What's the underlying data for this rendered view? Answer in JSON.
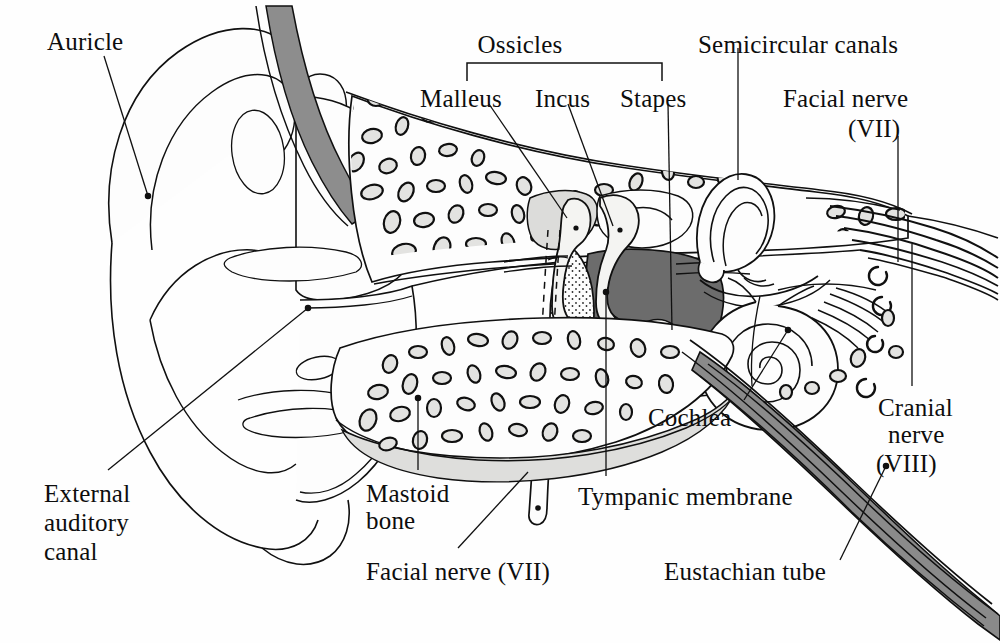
{
  "figure": {
    "background_color": "#fefefe",
    "ink_color": "#101010"
  },
  "palette": {
    "ink": "#101010",
    "paper": "#fefefe",
    "cartilage_light": "#f2f2f0",
    "bone_light_gray": "#e6e6e4",
    "canal_gray": "#8d8d8d",
    "middle_ear_cavity": "#6c6c6c",
    "eustachian_gray": "#8a8a8a",
    "marrow_fill": "#d9d9d7"
  },
  "labels": [
    {
      "id": "auricle",
      "text": "Auricle",
      "x": 47,
      "y": 28,
      "align": "left"
    },
    {
      "id": "ossicles",
      "text": "Ossicles",
      "x": 519,
      "y": 31,
      "align": "center"
    },
    {
      "id": "semicircular",
      "text": "Semicircular canals",
      "x": 698,
      "y": 31,
      "align": "left"
    },
    {
      "id": "malleus",
      "text": "Malleus",
      "x": 420,
      "y": 85,
      "align": "left"
    },
    {
      "id": "incus",
      "text": "Incus",
      "x": 535,
      "y": 85,
      "align": "left"
    },
    {
      "id": "stapes",
      "text": "Stapes",
      "x": 620,
      "y": 85,
      "align": "left"
    },
    {
      "id": "facial-nerve-vii",
      "text": "Facial nerve",
      "x": 783,
      "y": 85,
      "align": "left"
    },
    {
      "id": "facial-nerve-vii-n",
      "text": "(VII)",
      "x": 810,
      "y": 115,
      "align": "left"
    },
    {
      "id": "cochlea",
      "text": "Cochlea",
      "x": 648,
      "y": 404,
      "align": "left"
    },
    {
      "id": "cranial-nerve",
      "text": "Cranial",
      "x": 878,
      "y": 394,
      "align": "left"
    },
    {
      "id": "cranial-nerve-2",
      "text": "nerve",
      "x": 886,
      "y": 420,
      "align": "left"
    },
    {
      "id": "cranial-nerve-3",
      "text": "(VIII)",
      "x": 876,
      "y": 450,
      "align": "left"
    },
    {
      "id": "mastoid-bone",
      "text": "Mastoid",
      "x": 366,
      "y": 480,
      "align": "left"
    },
    {
      "id": "mastoid-bone-2",
      "text": "bone",
      "x": 366,
      "y": 508,
      "align": "left"
    },
    {
      "id": "tympanic-membrane",
      "text": "Tympanic membrane",
      "x": 578,
      "y": 483,
      "align": "left"
    },
    {
      "id": "external-canal",
      "text": "External",
      "x": 44,
      "y": 480,
      "align": "left"
    },
    {
      "id": "external-canal-2",
      "text": "auditory",
      "x": 44,
      "y": 509,
      "align": "left"
    },
    {
      "id": "external-canal-3",
      "text": "canal",
      "x": 44,
      "y": 538,
      "align": "left"
    },
    {
      "id": "facial-nerve-lower",
      "text": "Facial nerve (VII)",
      "x": 366,
      "y": 558,
      "align": "left"
    },
    {
      "id": "eustachian-tube",
      "text": "Eustachian tube",
      "x": 664,
      "y": 558,
      "align": "left"
    }
  ],
  "structures": [
    "auricle",
    "external auditory canal",
    "tympanic membrane",
    "middle ear cavity",
    "malleus",
    "incus",
    "stapes",
    "mastoid bone",
    "semicircular canals",
    "cochlea",
    "facial nerve (VII)",
    "cranial nerve (VIII)",
    "eustachian tube"
  ],
  "bracket": {
    "label": "Ossicles",
    "left_x": 467,
    "right_x": 662,
    "top_y": 63,
    "drop": 18
  }
}
